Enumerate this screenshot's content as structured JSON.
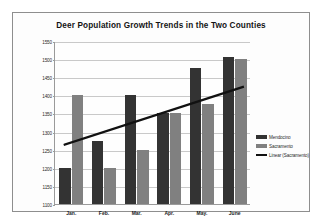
{
  "chart_data": {
    "type": "bar",
    "title": "Deer Population Growth Trends in the Two Counties",
    "xlabel": "",
    "ylabel": "",
    "categories": [
      "Jan.",
      "Feb.",
      "Mar.",
      "Apr.",
      "May.",
      "June"
    ],
    "series": [
      {
        "name": "Mendocino",
        "color": "#333333",
        "values": [
          1200,
          1275,
          1400,
          1350,
          1475,
          1505
        ]
      },
      {
        "name": "Sacramento",
        "color": "#808080",
        "values": [
          1400,
          1200,
          1250,
          1350,
          1375,
          1500
        ]
      }
    ],
    "trendline": {
      "name": "Linear (Sacramento)",
      "color": "#111111",
      "start_value": 1265,
      "end_value": 1425
    },
    "ylim": [
      1100,
      1550
    ],
    "yticks": [
      1100,
      1150,
      1200,
      1250,
      1300,
      1350,
      1400,
      1450,
      1500,
      1550
    ],
    "ytick_labels": [
      "1100",
      "1150",
      "1200",
      "1250",
      "1300",
      "1350",
      "1400",
      "1450",
      "1500",
      "1550"
    ],
    "grid": true,
    "legend_position": "right",
    "legend": [
      "Mendocino",
      "Sacramento",
      "Linear (Sacramento)"
    ]
  },
  "colors": {
    "mendocino": "#333333",
    "sacramento": "#808080",
    "trendline": "#111111",
    "gridline": "#c9c9c9",
    "frame": "#8e8e8e"
  }
}
